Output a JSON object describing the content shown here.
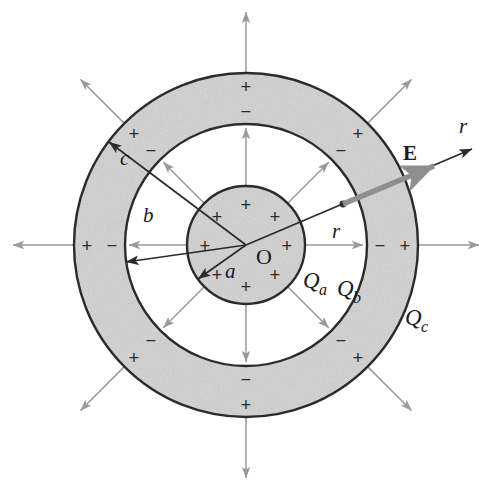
{
  "figure": {
    "background_color": "#ffffff",
    "center_label": "O",
    "colors": {
      "shell_fill": "#d6d6d6",
      "inner_sphere_fill": "#d6d6d6",
      "outline": "#2b2b2b",
      "field_ray": "#9a9a9a",
      "e_vector": "#8f8f8f",
      "radius_line": "#2b2b2b",
      "text": "#1a1a1a"
    },
    "geometry": {
      "center_x": 246,
      "center_y": 245,
      "radius_a": 59,
      "radius_b": 121,
      "radius_c": 172,
      "radius_r_point": 105
    },
    "labels": {
      "a": "a",
      "b": "b",
      "c": "c",
      "origin": "O",
      "Qa": "Q",
      "Qa_sub": "a",
      "Qb": "Q",
      "Qb_sub": "b",
      "Qc": "Q",
      "Qc_sub": "c",
      "E": "E",
      "r_inner": "r",
      "r_outer": "r"
    },
    "charge_signs": {
      "inner_sphere": "+",
      "shell_inner_surface": "−",
      "shell_outer_surface": "+"
    },
    "inner_sphere_plus_angles_deg": [
      0,
      45,
      90,
      135,
      180,
      225,
      270,
      315
    ],
    "shell_inner_minus_angles_deg": [
      0,
      45,
      90,
      135,
      180,
      225,
      270,
      315
    ],
    "shell_outer_plus_angles_deg": [
      0,
      45,
      90,
      135,
      180,
      225,
      270,
      315
    ],
    "field_ray_angles_deg": [
      0,
      45,
      90,
      135,
      180,
      225,
      270,
      315
    ],
    "e_vector_angle_deg": 23,
    "radius_arrow_angles_deg": {
      "a": 215,
      "b": 172,
      "c": 143
    }
  }
}
